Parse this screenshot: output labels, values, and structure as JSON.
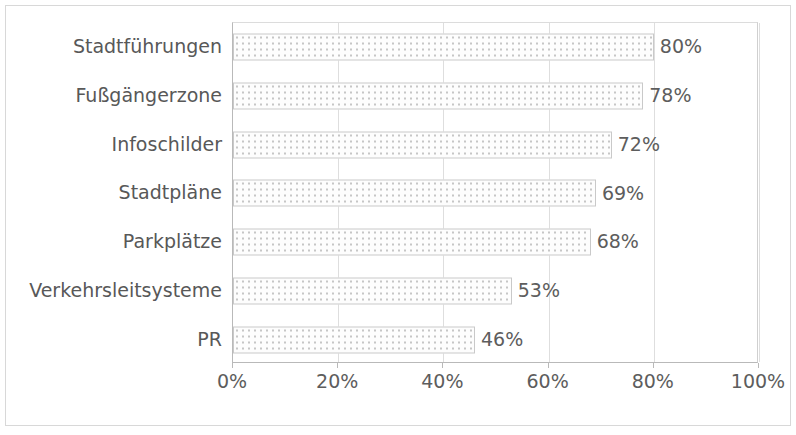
{
  "chart_data": {
    "type": "bar",
    "orientation": "horizontal",
    "title": "",
    "subtitle": "",
    "xlabel": "",
    "ylabel": "",
    "xlim": [
      0,
      100
    ],
    "grid": true,
    "legend": null,
    "value_suffix": "%",
    "categories": [
      "Stadtführungen",
      "Fußgängerzone",
      "Infoschilder",
      "Stadtpläne",
      "Parkplätze",
      "Verkehrsleitsysteme",
      "PR"
    ],
    "values": [
      80,
      78,
      72,
      69,
      68,
      53,
      46
    ],
    "data_labels": [
      "80%",
      "78%",
      "72%",
      "69%",
      "68%",
      "53%",
      "46%"
    ],
    "xticks": [
      0,
      20,
      40,
      60,
      80,
      100
    ],
    "xtick_labels": [
      "0%",
      "20%",
      "40%",
      "60%",
      "80%",
      "100%"
    ],
    "bar_fill": "#fdfdfd",
    "bar_border": "#c9c9c9",
    "text_color": "#585858",
    "grid_color": "#dedede",
    "points": [
      {
        "category": "Stadtführungen",
        "value": 80,
        "label": "80%"
      },
      {
        "category": "Fußgängerzone",
        "value": 78,
        "label": "78%"
      },
      {
        "category": "Infoschilder",
        "value": 72,
        "label": "72%"
      },
      {
        "category": "Stadtpläne",
        "value": 69,
        "label": "69%"
      },
      {
        "category": "Parkplätze",
        "value": 68,
        "label": "68%"
      },
      {
        "category": "Verkehrsleitsysteme",
        "value": 53,
        "label": "53%"
      },
      {
        "category": "PR",
        "value": 46,
        "label": "46%"
      }
    ]
  }
}
